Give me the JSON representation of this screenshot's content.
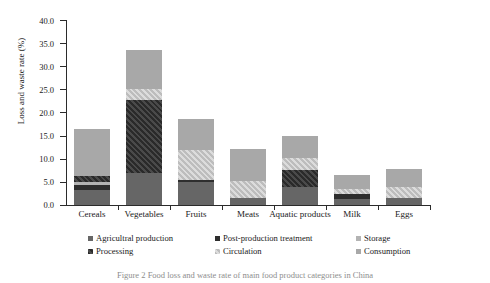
{
  "chart_data": {
    "type": "bar",
    "stacked": true,
    "title": "",
    "xlabel": "",
    "ylabel": "Loss and waste rate (%)",
    "ylim": [
      0,
      40
    ],
    "ytick_labels": [
      "0.0",
      "5.0",
      "10.0",
      "15.0",
      "20.0",
      "25.0",
      "30.0",
      "35.0",
      "40.0"
    ],
    "ytick_values": [
      0,
      5,
      10,
      15,
      20,
      25,
      30,
      35,
      40
    ],
    "grid": false,
    "legend_position": "below-axis",
    "categories": [
      "Cereals",
      "Vegetables",
      "Fruits",
      "Meats",
      "Aquatic products",
      "Milk",
      "Eggs"
    ],
    "series": [
      {
        "name": "Agricultral production",
        "values": [
          3.2,
          7.0,
          4.9,
          1.6,
          3.9,
          1.4,
          1.6
        ]
      },
      {
        "name": "Post-production treatment",
        "values": [
          1.2,
          0.0,
          0.5,
          0.0,
          0.0,
          0.9,
          0.0
        ]
      },
      {
        "name": "Storage",
        "values": [
          0.6,
          0.0,
          0.0,
          0.0,
          0.0,
          0.0,
          0.0
        ]
      },
      {
        "name": "Processing",
        "values": [
          1.3,
          15.8,
          0.0,
          0.0,
          3.7,
          0.0,
          0.0
        ]
      },
      {
        "name": "Circulation",
        "values": [
          0.0,
          2.2,
          6.5,
          3.5,
          2.6,
          1.1,
          2.4
        ]
      },
      {
        "name": "Consumption",
        "values": [
          10.2,
          8.5,
          6.6,
          7.1,
          4.8,
          3.0,
          3.8
        ]
      }
    ],
    "totals": [
      16.5,
      33.5,
      18.5,
      12.2,
      15.0,
      6.4,
      7.8
    ]
  },
  "legend": {
    "items": [
      {
        "label": "Agricultral production",
        "color": "#666666"
      },
      {
        "label": "Post-production treatment",
        "color": "#2e2e2e"
      },
      {
        "label": "Storage",
        "color": "#b3b3b3"
      },
      {
        "label": "Processing",
        "color": "#3a3a3a"
      },
      {
        "label": "Circulation",
        "color": "#cfcfcf"
      },
      {
        "label": "Consumption",
        "color": "#a8a8a8"
      }
    ]
  },
  "caption": {
    "text": "Figure 2 Food loss and waste rate of main food product categories in China"
  }
}
